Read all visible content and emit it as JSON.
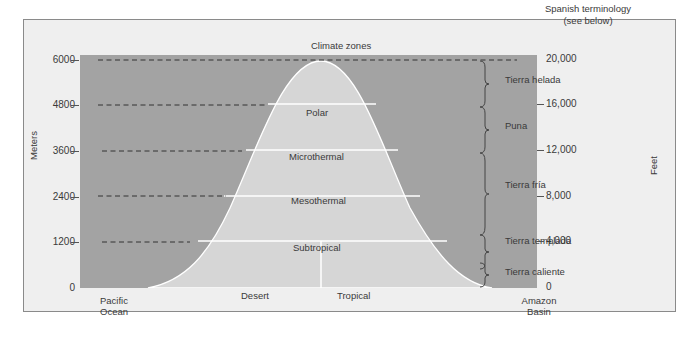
{
  "header": {
    "top_label": "Climate zones",
    "right_label_line1": "Spanish terminology",
    "right_label_line2": "(see below)"
  },
  "axes": {
    "left_title": "Meters",
    "right_title": "Feet",
    "left_ticks": [
      "6000",
      "4800",
      "3600",
      "2400",
      "1200",
      "0"
    ],
    "right_ticks": [
      "20,000",
      "16,000",
      "12,000",
      "8,000",
      "4,000",
      "0"
    ]
  },
  "bottom": {
    "left_line1": "Pacific",
    "left_line2": "Ocean",
    "right_line1": "Amazon",
    "right_line2": "Basin"
  },
  "climate_zones": [
    {
      "name": "Polar",
      "min_m": 4800,
      "max_m": 6000
    },
    {
      "name": "Microthermal",
      "min_m": 3600,
      "max_m": 4800
    },
    {
      "name": "Mesothermal",
      "min_m": 2400,
      "max_m": 3600
    },
    {
      "name": "Subtropical",
      "min_m": 1200,
      "max_m": 2400
    },
    {
      "name": "Desert",
      "min_m": 0,
      "max_m": 1200,
      "side": "west"
    },
    {
      "name": "Tropical",
      "min_m": 0,
      "max_m": 1200,
      "side": "east"
    }
  ],
  "spanish_zones": [
    {
      "name": "Tierra helada"
    },
    {
      "name": "Puna"
    },
    {
      "name": "Tierra fría"
    },
    {
      "name": "Tierra templada"
    },
    {
      "name": "Tierra caliente"
    }
  ],
  "colors": {
    "background_frame": "#efefef",
    "plot_fill": "#a3a3a3",
    "mountain_fill": "#d6d6d6",
    "lines": "#ffffff"
  }
}
